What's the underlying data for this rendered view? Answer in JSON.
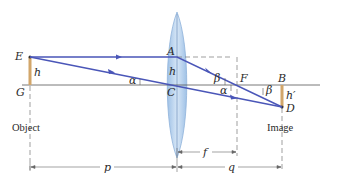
{
  "diagram": {
    "colors": {
      "ray": "#4a56b8",
      "lens_fill": "#b9d3ec",
      "lens_stroke": "#8fb3da",
      "object": "#d2a66a",
      "axis": "#444444",
      "dashed": "#666666"
    },
    "points": {
      "E": "E",
      "G": "G",
      "A": "A",
      "C": "C",
      "F": "F",
      "B": "B",
      "D": "D"
    },
    "labels": {
      "object_height": "h",
      "lens_height": "h",
      "image_height": "h′",
      "angle_alpha_left": "α",
      "angle_alpha_right": "α",
      "angle_beta_left": "β",
      "angle_beta_right": "β"
    },
    "captions": {
      "object": "Object",
      "image": "Image"
    },
    "dimensions": {
      "p": "p",
      "f": "f",
      "q": "q"
    }
  }
}
